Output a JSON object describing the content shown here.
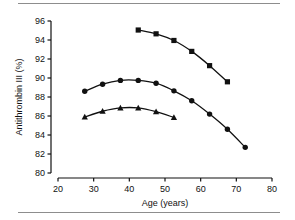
{
  "chart_data": {
    "type": "line",
    "title": "",
    "xlabel": "Age (years)",
    "ylabel": "Antithrombin III (%)",
    "xlim": [
      20,
      80
    ],
    "ylim": [
      80,
      96
    ],
    "xticks": [
      20,
      30,
      40,
      50,
      60,
      70,
      80
    ],
    "xtick_labels": [
      "20",
      "30",
      "40",
      "50",
      "60",
      "70",
      "80"
    ],
    "yticks": [
      80,
      82,
      84,
      86,
      88,
      90,
      92,
      94,
      96
    ],
    "ytick_labels": [
      "80",
      "82",
      "84",
      "86",
      "88",
      "90",
      "92",
      "94",
      "96"
    ],
    "grid": false,
    "legend": "none",
    "series": [
      {
        "name": "upper-series",
        "marker": "square",
        "color": "#111111",
        "x": [
          42.5,
          47.5,
          52.5,
          57.5,
          62.5,
          67.5
        ],
        "y": [
          95.05,
          94.65,
          93.95,
          92.8,
          91.3,
          89.6
        ]
      },
      {
        "name": "middle-series",
        "marker": "circle",
        "color": "#111111",
        "x": [
          27.5,
          32.5,
          37.5,
          42.5,
          47.5,
          52.5,
          57.5,
          62.5,
          67.5,
          72.5
        ],
        "y": [
          88.6,
          89.35,
          89.75,
          89.75,
          89.45,
          88.65,
          87.6,
          86.2,
          84.6,
          82.7
        ]
      },
      {
        "name": "lower-series",
        "marker": "triangle",
        "color": "#111111",
        "x": [
          27.5,
          32.5,
          37.5,
          42.5,
          47.5,
          52.5
        ],
        "y": [
          85.9,
          86.5,
          86.85,
          86.85,
          86.45,
          85.85
        ]
      }
    ]
  },
  "figure": {
    "axis_color": "#111111",
    "rule_color": "#8d8d8d",
    "background": "#ffffff"
  }
}
